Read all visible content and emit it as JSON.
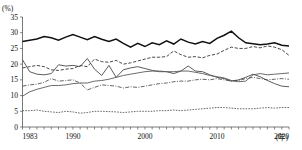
{
  "chart_data": {
    "type": "line",
    "title": "",
    "xlabel": "年",
    "ylabel": "(%)",
    "unit_label": "(%)",
    "xaxis_suffix": "(年)",
    "ylim": [
      0,
      35
    ],
    "yticks": [
      0,
      5,
      10,
      15,
      20,
      25,
      30,
      35
    ],
    "xlim": [
      1983,
      2020
    ],
    "xticks": [
      1983,
      1990,
      2000,
      2010,
      2020
    ],
    "xtick_labels": [
      "1983",
      "1990",
      "2000",
      "2010",
      "2020"
    ],
    "grid": false,
    "legend": "none",
    "x": [
      1983,
      1984,
      1985,
      1986,
      1987,
      1988,
      1989,
      1990,
      1991,
      1992,
      1993,
      1994,
      1995,
      1996,
      1997,
      1998,
      1999,
      2000,
      2001,
      2002,
      2003,
      2004,
      2005,
      2006,
      2007,
      2008,
      2009,
      2010,
      2011,
      2012,
      2013,
      2014,
      2015,
      2016,
      2017,
      2018,
      2019,
      2020
    ],
    "series": [
      {
        "name": "series-1-thick-solid",
        "style": "thick-solid",
        "values": [
          27.2,
          27.6,
          28.0,
          28.8,
          28.4,
          27.6,
          28.6,
          29.4,
          28.6,
          27.8,
          28.8,
          27.9,
          27.2,
          28.0,
          26.6,
          25.4,
          26.6,
          25.6,
          26.8,
          26.2,
          27.4,
          26.4,
          28.0,
          27.0,
          26.4,
          27.2,
          26.6,
          28.2,
          29.2,
          30.5,
          28.4,
          26.8,
          26.5,
          26.2,
          26.4,
          26.8,
          26.0,
          25.8
        ]
      },
      {
        "name": "series-2-dashed",
        "style": "dashed",
        "values": [
          18.8,
          19.2,
          19.6,
          19.2,
          18.2,
          18.0,
          18.4,
          18.6,
          19.6,
          19.2,
          21.6,
          20.8,
          20.6,
          21.2,
          20.0,
          20.4,
          21.0,
          21.6,
          22.2,
          22.2,
          22.4,
          24.2,
          23.0,
          22.2,
          22.4,
          22.0,
          22.8,
          23.2,
          24.4,
          25.4,
          25.0,
          25.0,
          25.6,
          25.2,
          25.8,
          25.4,
          24.6,
          22.8
        ]
      },
      {
        "name": "series-3-solid-declining",
        "style": "solid",
        "values": [
          21.4,
          17.6,
          16.8,
          16.6,
          17.0,
          19.8,
          19.4,
          19.6,
          19.2,
          21.8,
          18.4,
          16.4,
          19.6,
          15.8,
          18.2,
          18.8,
          19.2,
          18.6,
          18.0,
          17.6,
          17.6,
          17.0,
          17.8,
          19.4,
          17.8,
          17.6,
          16.6,
          15.8,
          15.4,
          14.6,
          15.0,
          15.8,
          16.8,
          16.0,
          14.8,
          13.8,
          13.0,
          12.8
        ]
      },
      {
        "name": "series-4-solid-rising",
        "style": "solid",
        "values": [
          9.8,
          11.2,
          12.0,
          12.6,
          13.2,
          13.2,
          13.4,
          13.8,
          14.0,
          14.0,
          14.6,
          14.8,
          15.2,
          15.8,
          16.4,
          16.8,
          17.2,
          17.6,
          17.8,
          17.8,
          17.6,
          17.6,
          17.8,
          17.8,
          17.4,
          17.0,
          16.4,
          16.0,
          15.6,
          14.8,
          14.4,
          14.6,
          16.6,
          17.0,
          16.6,
          16.8,
          17.0,
          17.2
        ]
      },
      {
        "name": "series-5-dash-dot",
        "style": "dash-dot",
        "values": [
          13.0,
          13.4,
          13.6,
          14.2,
          15.4,
          14.6,
          14.8,
          15.0,
          14.0,
          11.8,
          12.6,
          13.4,
          13.2,
          13.0,
          12.4,
          12.8,
          12.6,
          13.0,
          13.4,
          13.8,
          14.0,
          14.4,
          14.6,
          14.6,
          15.0,
          15.2,
          15.0,
          15.4,
          15.0,
          14.6,
          14.8,
          15.4,
          15.8,
          15.4,
          15.0,
          15.2,
          15.4,
          15.2
        ]
      },
      {
        "name": "series-6-dotted-lowest",
        "style": "dotted",
        "values": [
          5.2,
          5.2,
          5.4,
          5.0,
          4.8,
          4.6,
          5.0,
          4.8,
          4.4,
          4.6,
          5.0,
          5.0,
          4.9,
          4.8,
          4.6,
          4.8,
          5.0,
          5.0,
          5.0,
          5.2,
          5.2,
          5.4,
          5.2,
          5.4,
          5.6,
          5.8,
          6.0,
          6.2,
          6.2,
          6.0,
          5.8,
          5.8,
          5.8,
          6.0,
          6.2,
          6.0,
          6.2,
          6.2
        ]
      }
    ]
  },
  "footnote": {
    "text": ""
  }
}
